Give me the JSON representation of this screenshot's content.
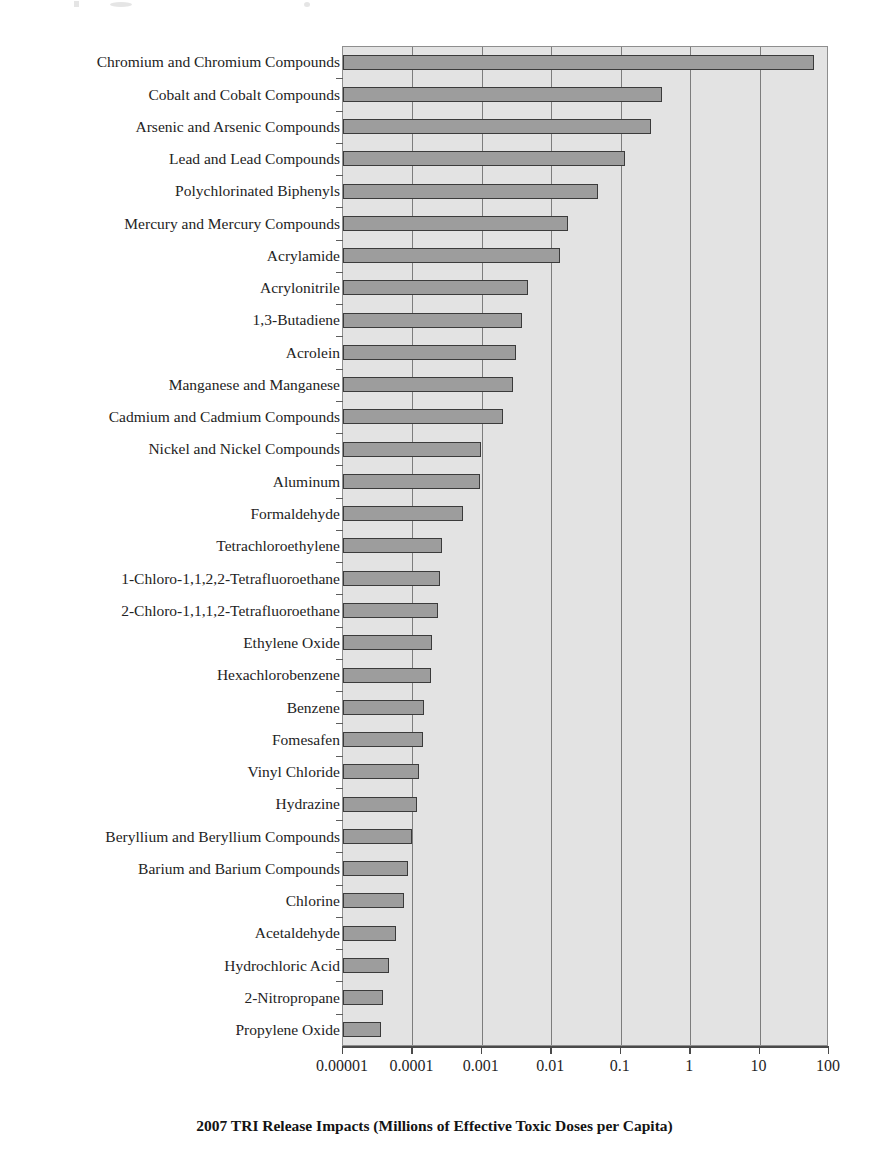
{
  "figure": {
    "background_color": "#ffffff",
    "plot_background_color": "#e3e3e3",
    "bar_fill_color": "#9d9d9d",
    "bar_border_color": "#3b3b3b",
    "gridline_color": "#7d7d7d"
  },
  "chart_data": {
    "type": "bar",
    "orientation": "horizontal",
    "title": "",
    "subtitle": "",
    "xlabel": "2007 TRI Release Impacts (Millions of Effective Toxic Doses per Capita)",
    "ylabel": "",
    "xscale": "log",
    "xlim": [
      1e-05,
      100
    ],
    "xticks": [
      1e-05,
      0.0001,
      0.001,
      0.01,
      0.1,
      1,
      10,
      100
    ],
    "xtick_labels": [
      "0.00001",
      "0.0001",
      "0.001",
      "0.01",
      "0.1",
      "1",
      "10",
      "100"
    ],
    "grid": "vertical",
    "legend": "none",
    "categories": [
      "Chromium and Chromium Compounds",
      "Cobalt and Cobalt Compounds",
      "Arsenic and Arsenic Compounds",
      "Lead and Lead Compounds",
      "Polychlorinated Biphenyls",
      "Mercury and Mercury Compounds",
      "Acrylamide",
      "Acrylonitrile",
      "1,3-Butadiene",
      "Acrolein",
      "Manganese and Manganese",
      "Cadmium and Cadmium Compounds",
      "Nickel and Nickel Compounds",
      "Aluminum",
      "Formaldehyde",
      "Tetrachloroethylene",
      "1-Chloro-1,1,2,2-Tetrafluoroethane",
      "2-Chloro-1,1,1,2-Tetrafluoroethane",
      "Ethylene Oxide",
      "Hexachlorobenzene",
      "Benzene",
      "Fomesafen",
      "Vinyl Chloride",
      "Hydrazine",
      "Beryllium and Beryllium Compounds",
      "Barium and Barium Compounds",
      "Chlorine",
      "Acetaldehyde",
      "Hydrochloric Acid",
      "2-Nitropropane",
      "Propylene Oxide"
    ],
    "values": [
      63,
      0.41,
      0.28,
      0.12,
      0.048,
      0.018,
      0.014,
      0.0047,
      0.0039,
      0.0032,
      0.0029,
      0.0021,
      0.00101,
      0.00096,
      0.00055,
      0.00028,
      0.00026,
      0.00024,
      0.0002,
      0.00019,
      0.000152,
      0.000148,
      0.000128,
      0.000122,
      0.000103,
      9e-05,
      7.8e-05,
      5.9e-05,
      4.7e-05,
      3.9e-05,
      3.6e-05
    ]
  }
}
